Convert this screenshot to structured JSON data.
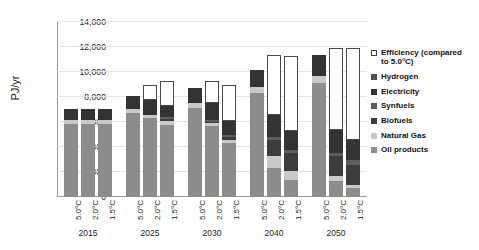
{
  "chart_data": {
    "type": "bar",
    "stacked": true,
    "title": "",
    "xlabel": "",
    "ylabel": "PJ/yr",
    "ylim": [
      0,
      14000
    ],
    "ytick_labels": [
      "0",
      "2,000",
      "4,000",
      "6,000",
      "8,000",
      "10,000",
      "12,000",
      "14,000"
    ],
    "ytick_values": [
      0,
      2000,
      4000,
      6000,
      8000,
      10000,
      12000,
      14000
    ],
    "grid": true,
    "legend_position": "right",
    "groups": [
      "2015",
      "2025",
      "2030",
      "2040",
      "2050"
    ],
    "scenarios": [
      "5.0°C",
      "2.0°C",
      "1.5°C"
    ],
    "categories": [
      "2015 5.0°C",
      "2015 2.0°C",
      "2015 1.5°C",
      "2025 5.0°C",
      "2025 2.0°C",
      "2025 1.5°C",
      "2030 5.0°C",
      "2030 2.0°C",
      "2030 1.5°C",
      "2040 5.0°C",
      "2040 2.0°C",
      "2040 1.5°C",
      "2050 5.0°C",
      "2050 2.0°C",
      "2050 1.5°C"
    ],
    "series": [
      {
        "name": "Oil products",
        "color": "#8c8c8c",
        "values": [
          5850,
          5850,
          5850,
          6700,
          6300,
          5800,
          7150,
          5650,
          4350,
          8350,
          2350,
          1350,
          9150,
          1300,
          750
        ]
      },
      {
        "name": "Natural Gas",
        "color": "#c9c9c9",
        "values": [
          300,
          300,
          300,
          350,
          300,
          250,
          400,
          250,
          200,
          450,
          900,
          750,
          500,
          350,
          250
        ]
      },
      {
        "name": "Biofuels",
        "color": "#3d3d3d",
        "values": [
          0,
          0,
          0,
          0,
          0,
          200,
          0,
          100,
          250,
          0,
          1300,
          1400,
          0,
          1600,
          1600
        ]
      },
      {
        "name": "Synfuels",
        "color": "#5e5e5e",
        "values": [
          0,
          0,
          0,
          0,
          0,
          150,
          0,
          150,
          200,
          0,
          250,
          300,
          0,
          300,
          350
        ]
      },
      {
        "name": "Electricity",
        "color": "#333333",
        "values": [
          900,
          900,
          900,
          1000,
          1150,
          900,
          1150,
          1400,
          1100,
          1400,
          1800,
          1500,
          1700,
          1800,
          1650
        ]
      },
      {
        "name": "Hydrogen",
        "color": "#4f4f4f",
        "values": [
          0,
          0,
          0,
          0,
          0,
          0,
          0,
          0,
          0,
          0,
          0,
          0,
          0,
          0,
          0
        ]
      },
      {
        "name": "Efficiency (compared to 5.0°C)",
        "color": "#ffffff",
        "values": [
          0,
          0,
          0,
          0,
          1200,
          2000,
          0,
          1750,
          2850,
          0,
          4800,
          6000,
          0,
          6550,
          7350
        ]
      }
    ]
  },
  "legend": {
    "items": [
      {
        "label": "Efficiency (compared\nto 5.0°C)",
        "swatch": "outline",
        "color": "#ffffff"
      },
      {
        "label": "Hydrogen",
        "swatch": "solid",
        "color": "#4f4f4f"
      },
      {
        "label": "Electricity",
        "swatch": "solid",
        "color": "#333333"
      },
      {
        "label": "Synfuels",
        "swatch": "solid",
        "color": "#5e5e5e"
      },
      {
        "label": "Biofuels",
        "swatch": "solid",
        "color": "#3d3d3d"
      },
      {
        "label": "Natural Gas",
        "swatch": "solid",
        "color": "#c9c9c9"
      },
      {
        "label": "Oil products",
        "swatch": "solid",
        "color": "#8c8c8c"
      }
    ]
  }
}
